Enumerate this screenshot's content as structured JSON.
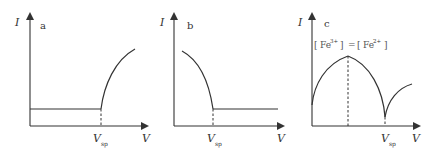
{
  "figure": {
    "panels": [
      {
        "id": "a",
        "label": "a",
        "y_axis_label": "I",
        "x_axis_label": "V",
        "marker_label": "V",
        "marker_subscript": "sp",
        "description": "Constant low current until V_sp, then current rises concavely"
      },
      {
        "id": "b",
        "label": "b",
        "y_axis_label": "I",
        "x_axis_label": "V",
        "marker_label": "V",
        "marker_subscript": "sp",
        "description": "Current falls from high value down to V_sp, then constant low current"
      },
      {
        "id": "c",
        "label": "c",
        "y_axis_label": "I",
        "x_axis_label": "V",
        "marker_label": "V",
        "marker_subscript": "sp",
        "peak_annotation": {
          "left_bracket": "[",
          "ion1": "Fe",
          "ion1_charge": "3+",
          "right_bracket": "]",
          "equals": "=",
          "ion2": "Fe",
          "ion2_charge": "2+"
        },
        "description": "Current rises to a maximum where [Fe3+] = [Fe2+], falls to a minimum at V_sp, then rises again"
      }
    ]
  },
  "colors": {
    "line": "#333333",
    "background": "#ffffff"
  }
}
